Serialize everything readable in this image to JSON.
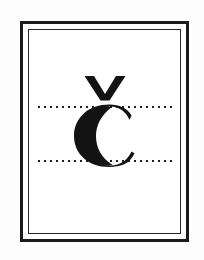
{
  "card": {
    "letter": "Č",
    "letter_name": "C with caron",
    "base_letter": "C",
    "diacritic": "caron",
    "ink_color": "#131313",
    "paper_color": "#ffffff",
    "page_background": "#fdfdfd"
  },
  "frame": {
    "outer_border_color": "#1a1a1a",
    "inner_border_color": "#242424",
    "outer_border_width": "3px",
    "inner_border_width": "1.5px"
  },
  "guides": {
    "line_color": "#1f1f1f",
    "style": "dotted",
    "lines": [
      {
        "id": "top-guide-line",
        "label": "x-height guide line"
      },
      {
        "id": "bottom-guide-line",
        "label": "baseline guide line"
      }
    ]
  }
}
